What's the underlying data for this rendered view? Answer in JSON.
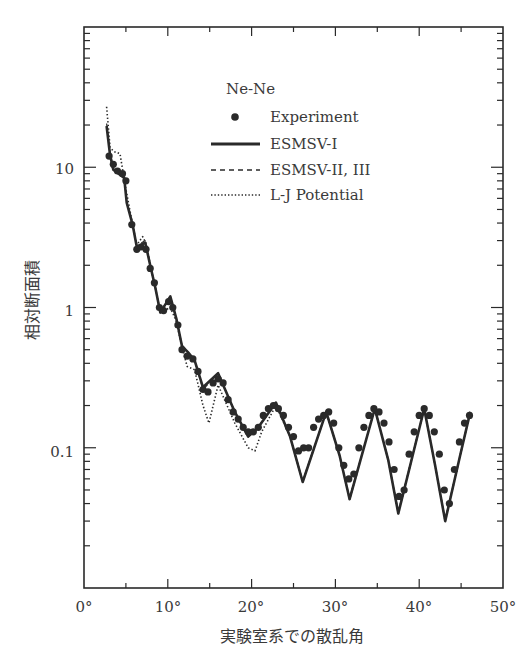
{
  "chart_data": {
    "type": "line",
    "title": "Ne-Ne",
    "xlabel": "実験室系での散乱角",
    "ylabel": "相対断面積",
    "xlim": [
      0,
      50
    ],
    "ylim": [
      0.01,
      100
    ],
    "yscale": "log",
    "grid": false,
    "x_ticks": [
      "0°",
      "10°",
      "20°",
      "30°",
      "40°",
      "50°"
    ],
    "y_ticks": [
      "0.1",
      "1",
      "10"
    ],
    "legend": {
      "position": "upper-right (inside)",
      "title": "Ne-Ne",
      "entries": [
        "Experiment",
        "ESMSV-I",
        "ESMSV-II, III",
        "L-J Potential"
      ]
    },
    "series": [
      {
        "name": "ESMSV-I",
        "style": "solid",
        "x": [
          2.7,
          3.1,
          3.5,
          4.8,
          5.1,
          5.8,
          6.3,
          7.3,
          7.9,
          8.5,
          9.1,
          10.3,
          11.0,
          11.7,
          12.4,
          13.2,
          14.2,
          16.0,
          18.0,
          19.6,
          20.8,
          22.9,
          24.6,
          26.1,
          28.9,
          30.5,
          31.7,
          34.7,
          36.3,
          37.5,
          40.6,
          41.9,
          43.1,
          44.9,
          46.1
        ],
        "y": [
          19.7,
          12.3,
          9.6,
          8.4,
          5.6,
          3.9,
          2.7,
          2.9,
          2.0,
          1.4,
          0.92,
          1.2,
          0.84,
          0.53,
          0.48,
          0.42,
          0.27,
          0.34,
          0.18,
          0.12,
          0.14,
          0.21,
          0.12,
          0.057,
          0.18,
          0.088,
          0.043,
          0.19,
          0.082,
          0.034,
          0.19,
          0.075,
          0.03,
          0.089,
          0.18
        ]
      },
      {
        "name": "ESMSV-II, III",
        "style": "dashed",
        "x": [
          2.7,
          3.1,
          3.5,
          4.8,
          5.1,
          5.8,
          6.3,
          7.3,
          7.9,
          8.5,
          9.1,
          10.3,
          11.0,
          11.7,
          12.4,
          13.2,
          14.2,
          16.0,
          18.0,
          19.6,
          20.8,
          22.9,
          24.6,
          26.1,
          28.9,
          30.5,
          31.7,
          34.7,
          36.3,
          37.5,
          40.6,
          41.9,
          43.1,
          44.9,
          46.1
        ],
        "y": [
          20.5,
          12.8,
          9.8,
          8.6,
          5.7,
          3.9,
          2.75,
          3.0,
          2.0,
          1.4,
          0.93,
          1.2,
          0.85,
          0.54,
          0.48,
          0.42,
          0.26,
          0.34,
          0.18,
          0.12,
          0.14,
          0.21,
          0.12,
          0.058,
          0.18,
          0.088,
          0.044,
          0.19,
          0.082,
          0.035,
          0.19,
          0.075,
          0.031,
          0.089,
          0.18
        ]
      },
      {
        "name": "L-J Potential",
        "style": "dotted",
        "x": [
          2.7,
          3.1,
          3.5,
          4.3,
          4.9,
          5.4,
          5.8,
          6.3,
          7.0,
          7.5,
          7.9,
          8.5,
          9.1,
          10.3,
          11.0,
          11.7,
          12.3,
          13.2,
          14.2,
          14.9,
          16.0,
          18.0,
          19.6,
          20.4,
          21.2,
          22.9,
          24.6,
          26.1,
          28.9,
          30.5,
          31.7,
          34.7,
          36.3,
          37.5,
          40.6,
          41.9,
          43.1,
          44.9,
          46.1
        ],
        "y": [
          27,
          14,
          13,
          12.5,
          7.5,
          5.2,
          3.9,
          2.8,
          3.2,
          2.8,
          2.0,
          1.4,
          0.92,
          1.0,
          0.8,
          0.52,
          0.38,
          0.36,
          0.2,
          0.15,
          0.28,
          0.15,
          0.1,
          0.095,
          0.13,
          0.2,
          0.12,
          0.057,
          0.18,
          0.088,
          0.043,
          0.19,
          0.082,
          0.034,
          0.19,
          0.075,
          0.03,
          0.089,
          0.18
        ]
      },
      {
        "name": "Experiment",
        "style": "markers",
        "x": [
          3.0,
          3.5,
          4.0,
          4.6,
          5.0,
          5.7,
          6.3,
          6.8,
          7.4,
          7.9,
          8.4,
          9.0,
          9.5,
          10.1,
          10.6,
          11.2,
          11.7,
          12.3,
          13.0,
          13.6,
          14.2,
          14.8,
          15.4,
          16.0,
          16.6,
          17.2,
          17.8,
          18.4,
          19.0,
          19.6,
          20.2,
          20.8,
          21.4,
          22.0,
          22.6,
          23.2,
          23.8,
          24.4,
          25.0,
          25.6,
          26.2,
          26.8,
          27.4,
          28.0,
          28.6,
          29.2,
          29.8,
          30.4,
          31.0,
          31.6,
          32.2,
          32.8,
          33.4,
          34.0,
          34.6,
          35.2,
          35.8,
          36.4,
          37.0,
          37.6,
          38.2,
          38.8,
          39.4,
          40.0,
          40.6,
          41.2,
          41.8,
          42.4,
          43.0,
          43.6,
          44.2,
          44.8,
          45.4,
          46.0
        ],
        "y": [
          12,
          10.5,
          9.4,
          9.0,
          8.0,
          3.9,
          2.6,
          2.7,
          2.6,
          1.9,
          1.5,
          1.0,
          0.95,
          1.1,
          1.0,
          0.75,
          0.5,
          0.45,
          0.43,
          0.35,
          0.26,
          0.25,
          0.29,
          0.31,
          0.29,
          0.22,
          0.18,
          0.16,
          0.14,
          0.13,
          0.13,
          0.14,
          0.17,
          0.19,
          0.2,
          0.19,
          0.17,
          0.14,
          0.12,
          0.095,
          0.1,
          0.1,
          0.14,
          0.16,
          0.17,
          0.18,
          0.15,
          0.1,
          0.075,
          0.06,
          0.065,
          0.1,
          0.14,
          0.17,
          0.19,
          0.18,
          0.15,
          0.11,
          0.07,
          0.045,
          0.05,
          0.09,
          0.13,
          0.17,
          0.19,
          0.17,
          0.13,
          0.09,
          0.05,
          0.04,
          0.07,
          0.11,
          0.15,
          0.17
        ]
      }
    ]
  },
  "legend": {
    "title": "Ne-Ne",
    "experiment": "Experiment",
    "esmsv1": "ESMSV-I",
    "esmsv23": "ESMSV-II, III",
    "lj": "L-J Potential"
  },
  "axes": {
    "xlabel": "実験室系での散乱角",
    "ylabel": "相対断面積",
    "x_tick_labels": [
      "0°",
      "10°",
      "20°",
      "30°",
      "40°",
      "50°"
    ],
    "y_tick_labels": [
      "10",
      "1",
      "0.1"
    ]
  }
}
